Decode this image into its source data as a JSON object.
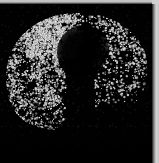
{
  "panel": {
    "width": 159,
    "height": 163,
    "background_color": "#000000",
    "modality": "fluorescence-microscopy",
    "channel": "grayscale",
    "caption": ""
  },
  "edges": {
    "top_strip": {
      "name": "page-margin-top",
      "color": "#d2d2d2",
      "height_px": 4
    },
    "right_strip": {
      "name": "page-margin-right",
      "color": "#d6d6d6",
      "width_px": 7
    }
  },
  "image_field": {
    "name": "microscopy-image-field",
    "background_color": "#010101",
    "left_px": 0,
    "top_px": 4,
    "width_px": 152,
    "height_px": 159
  },
  "specimen": {
    "name": "labelled-tissue-section",
    "shape": "hemispheric-D-shaped",
    "signal_color": "#e8e8e8",
    "bounds_px": {
      "x": 3,
      "y": 12,
      "width": 147,
      "height": 118
    },
    "regions": [
      {
        "label": "dense-speckle-left",
        "density": "high",
        "x": 3,
        "y": 30,
        "width": 60,
        "height": 98
      },
      {
        "label": "dense-speckle-upper",
        "density": "high",
        "x": 28,
        "y": 14,
        "width": 52,
        "height": 42
      },
      {
        "label": "sparse-puncta-right",
        "density": "moderate",
        "x": 95,
        "y": 18,
        "width": 55,
        "height": 85
      },
      {
        "label": "central-dark-lumen",
        "density": "none",
        "x": 57,
        "y": 25,
        "width": 52,
        "height": 52
      }
    ]
  },
  "chart_data": {
    "type": "heatmap",
    "title": "",
    "xlabel": "",
    "ylabel": "",
    "grid": false,
    "legend": null,
    "intensity_scale": {
      "min": 0,
      "max": 255,
      "unit": "gray-level"
    },
    "zone_mean_intensity": [
      {
        "zone": "superior-arc",
        "value": 148
      },
      {
        "zone": "left-lateral",
        "value": 132
      },
      {
        "zone": "inferior-left",
        "value": 118
      },
      {
        "zone": "central-lumen",
        "value": 6
      },
      {
        "zone": "right-lateral",
        "value": 96
      },
      {
        "zone": "inferior-right",
        "value": 54
      },
      {
        "zone": "background-field",
        "value": 2
      }
    ]
  }
}
